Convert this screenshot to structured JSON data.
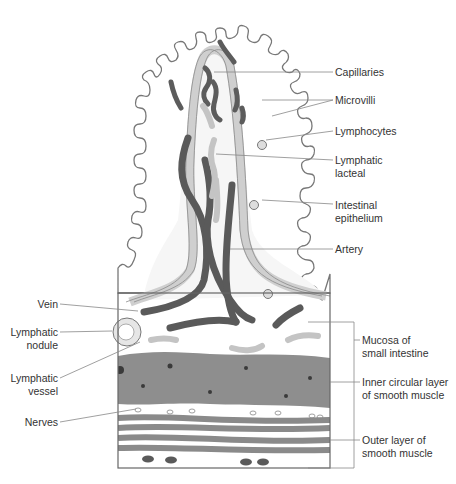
{
  "diagram": {
    "colors": {
      "outline": "#777777",
      "epithelium_fill": "#ffffff",
      "lamina": "#f2f2f2",
      "lacteal_ring": "#d9d9d9",
      "capillary_dark": "#5a5a5a",
      "lymph_light": "#c4c4c4",
      "inner_muscle": "#8c8c8c",
      "outer_muscle": "#8a8a8a",
      "leader_line": "#888888",
      "text": "#333333"
    },
    "labels_right": [
      {
        "id": "capillaries",
        "text": "Capillaries"
      },
      {
        "id": "microvilli",
        "text": "Microvilli"
      },
      {
        "id": "lymphocytes",
        "text": "Lymphocytes"
      },
      {
        "id": "lymphatic-lacteal",
        "line1": "Lymphatic",
        "line2": "lacteal"
      },
      {
        "id": "intestinal-epithelium",
        "line1": "Intestinal",
        "line2": "epithelium"
      },
      {
        "id": "artery",
        "text": "Artery"
      },
      {
        "id": "mucosa",
        "line1": "Mucosa of",
        "line2": "small intestine"
      },
      {
        "id": "inner-circular",
        "line1": "Inner circular layer",
        "line2": "of smooth muscle"
      },
      {
        "id": "outer-layer",
        "line1": "Outer layer of",
        "line2": "smooth muscle"
      }
    ],
    "labels_left": [
      {
        "id": "vein",
        "text": "Vein"
      },
      {
        "id": "lymphatic-nodule",
        "line1": "Lymphatic",
        "line2": "nodule"
      },
      {
        "id": "lymphatic-vessel",
        "line1": "Lymphatic",
        "line2": "vessel"
      },
      {
        "id": "nerves",
        "text": "Nerves"
      }
    ]
  }
}
